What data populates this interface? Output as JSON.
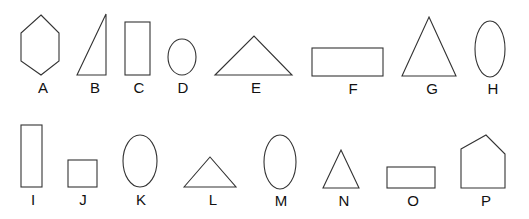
{
  "figure": {
    "width": 529,
    "height": 219,
    "stroke_color": "#333333",
    "background": "#ffffff"
  },
  "shapes": [
    {
      "label": "A",
      "type": "hexagon",
      "points": "41,15 59,33 59,61 41,75 21,61 21,33",
      "label_x": 43,
      "label_y": 93
    },
    {
      "label": "B",
      "type": "right-triangle",
      "points": "106,14 106,75 77,75",
      "label_x": 95,
      "label_y": 93
    },
    {
      "label": "C",
      "type": "rectangle",
      "x": 125,
      "y": 22,
      "w": 25,
      "h": 53,
      "label_x": 139,
      "label_y": 93
    },
    {
      "label": "D",
      "type": "ellipse",
      "cx": 182,
      "cy": 57,
      "rx": 14,
      "ry": 18,
      "label_x": 183,
      "label_y": 93
    },
    {
      "label": "E",
      "type": "triangle",
      "points": "215,75 254,36 292,75",
      "label_x": 256,
      "label_y": 93
    },
    {
      "label": "F",
      "type": "rectangle",
      "x": 312,
      "y": 48,
      "w": 71,
      "h": 28,
      "label_x": 353,
      "label_y": 94
    },
    {
      "label": "G",
      "type": "triangle",
      "points": "429,17 456,76 402,76",
      "label_x": 432,
      "label_y": 94
    },
    {
      "label": "H",
      "type": "ellipse",
      "cx": 490,
      "cy": 49,
      "rx": 15,
      "ry": 28,
      "label_x": 493,
      "label_y": 94
    },
    {
      "label": "I",
      "type": "rectangle",
      "x": 21,
      "y": 125,
      "w": 21,
      "h": 62,
      "label_x": 33,
      "label_y": 205
    },
    {
      "label": "J",
      "type": "square",
      "x": 68,
      "y": 160,
      "w": 29,
      "h": 27,
      "label_x": 83,
      "label_y": 205
    },
    {
      "label": "K",
      "type": "ellipse",
      "cx": 140,
      "cy": 161,
      "rx": 17,
      "ry": 26,
      "label_x": 141,
      "label_y": 205
    },
    {
      "label": "L",
      "type": "triangle",
      "points": "184,187 210,157 236,187",
      "label_x": 213,
      "label_y": 205
    },
    {
      "label": "M",
      "type": "ellipse",
      "cx": 280,
      "cy": 162,
      "rx": 16,
      "ry": 27,
      "label_x": 281,
      "label_y": 206
    },
    {
      "label": "N",
      "type": "triangle",
      "points": "341,150 359,188 323,188",
      "label_x": 344,
      "label_y": 206
    },
    {
      "label": "O",
      "type": "rectangle",
      "x": 387,
      "y": 167,
      "w": 48,
      "h": 21,
      "label_x": 413,
      "label_y": 206
    },
    {
      "label": "P",
      "type": "pentagon",
      "points": "461,149 486,135 505,154 505,188 461,188",
      "label_x": 486,
      "label_y": 206
    }
  ]
}
